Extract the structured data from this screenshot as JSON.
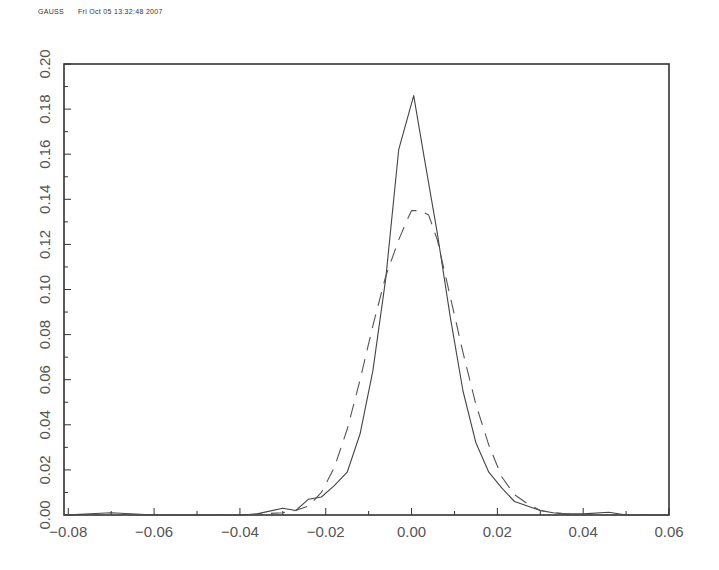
{
  "header": {
    "program": "GAUSS",
    "timestamp": "Fri Oct 05 13:32:48 2007"
  },
  "chart_data": {
    "type": "line",
    "title": "",
    "xlabel": "",
    "ylabel": "",
    "xlim": [
      -0.081,
      0.06
    ],
    "ylim": [
      0.0,
      0.2
    ],
    "grid": false,
    "legend": null,
    "x_ticks": [
      "-0.08",
      "-0.06",
      "-0.04",
      "-0.02",
      "0.00",
      "0.02",
      "0.04",
      "0.06"
    ],
    "x_tick_values": [
      -0.08,
      -0.06,
      -0.04,
      -0.02,
      0.0,
      0.02,
      0.04,
      0.06
    ],
    "y_ticks": [
      "0.00",
      "0.02",
      "0.04",
      "0.06",
      "0.08",
      "0.10",
      "0.12",
      "0.14",
      "0.16",
      "0.18",
      "0.20"
    ],
    "y_tick_values": [
      0.0,
      0.02,
      0.04,
      0.06,
      0.08,
      0.1,
      0.12,
      0.14,
      0.16,
      0.18,
      0.2
    ],
    "series": [
      {
        "name": "empirical density",
        "style": "solid",
        "color": "#444444",
        "x": [
          -0.081,
          -0.07,
          -0.06,
          -0.05,
          -0.04,
          -0.036,
          -0.03,
          -0.027,
          -0.024,
          -0.021,
          -0.018,
          -0.015,
          -0.012,
          -0.009,
          -0.006,
          -0.003,
          0.0005,
          0.003,
          0.006,
          0.009,
          0.012,
          0.015,
          0.018,
          0.021,
          0.024,
          0.027,
          0.03,
          0.033,
          0.036,
          0.04,
          0.046,
          0.05,
          0.06
        ],
        "y": [
          0.0,
          0.001,
          0.0,
          0.0,
          0.0,
          0.0005,
          0.003,
          0.002,
          0.007,
          0.008,
          0.013,
          0.019,
          0.036,
          0.064,
          0.105,
          0.162,
          0.186,
          0.158,
          0.125,
          0.088,
          0.055,
          0.032,
          0.019,
          0.012,
          0.006,
          0.004,
          0.002,
          0.001,
          0.0005,
          0.0005,
          0.0012,
          0.0,
          0.0
        ]
      },
      {
        "name": "normal density",
        "style": "dashed",
        "color": "#555555",
        "x": [
          -0.081,
          -0.04,
          -0.035,
          -0.03,
          -0.027,
          -0.024,
          -0.021,
          -0.018,
          -0.015,
          -0.012,
          -0.009,
          -0.006,
          -0.003,
          -0.001,
          0.0,
          0.002,
          0.004,
          0.006,
          0.009,
          0.012,
          0.015,
          0.018,
          0.021,
          0.024,
          0.027,
          0.03,
          0.033,
          0.036,
          0.04,
          0.06
        ],
        "y": [
          0.0,
          0.0,
          0.0005,
          0.001,
          0.002,
          0.004,
          0.01,
          0.021,
          0.038,
          0.06,
          0.084,
          0.106,
          0.122,
          0.131,
          0.135,
          0.135,
          0.133,
          0.122,
          0.097,
          0.072,
          0.049,
          0.031,
          0.017,
          0.009,
          0.005,
          0.002,
          0.001,
          0.0005,
          0.0,
          0.0
        ]
      }
    ]
  }
}
